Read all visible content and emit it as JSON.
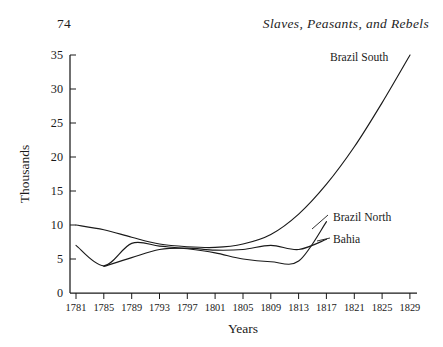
{
  "page": {
    "folio": "74",
    "running_head": "Slaves, Peasants, and Rebels"
  },
  "chart_data": {
    "type": "line",
    "title": "",
    "xlabel": "Years",
    "ylabel": "Thousands",
    "xlim": [
      1781,
      1829
    ],
    "ylim": [
      0,
      35
    ],
    "grid": false,
    "legend": "inline-right-labels",
    "x_ticks": [
      "1781",
      "1785",
      "1789",
      "1793",
      "1797",
      "1801",
      "1805",
      "1809",
      "1813",
      "1817",
      "1821",
      "1825",
      "1829"
    ],
    "y_ticks": [
      "0",
      "5",
      "10",
      "15",
      "20",
      "25",
      "30",
      "35"
    ],
    "series": [
      {
        "name": "Brazil South",
        "label": "Brazil South",
        "x": [
          1781,
          1785,
          1789,
          1793,
          1797,
          1801,
          1805,
          1809,
          1813,
          1817,
          1821,
          1825,
          1829
        ],
        "values": [
          10.0,
          9.3,
          8.2,
          7.2,
          6.8,
          6.7,
          7.2,
          8.6,
          11.6,
          16.0,
          21.5,
          28.0,
          35.0
        ]
      },
      {
        "name": "Brazil North",
        "label": "Brazil North",
        "x": [
          1781,
          1785,
          1789,
          1793,
          1797,
          1801,
          1805,
          1809,
          1813,
          1817
        ],
        "values": [
          7.0,
          4.0,
          7.3,
          6.9,
          6.5,
          5.9,
          5.0,
          4.6,
          4.7,
          10.5
        ]
      },
      {
        "name": "Bahia",
        "label": "Bahia",
        "x": [
          1785,
          1789,
          1793,
          1797,
          1801,
          1805,
          1809,
          1813,
          1817
        ],
        "values": [
          3.9,
          5.2,
          6.4,
          6.6,
          6.3,
          6.4,
          7.0,
          6.4,
          7.9
        ]
      }
    ]
  }
}
